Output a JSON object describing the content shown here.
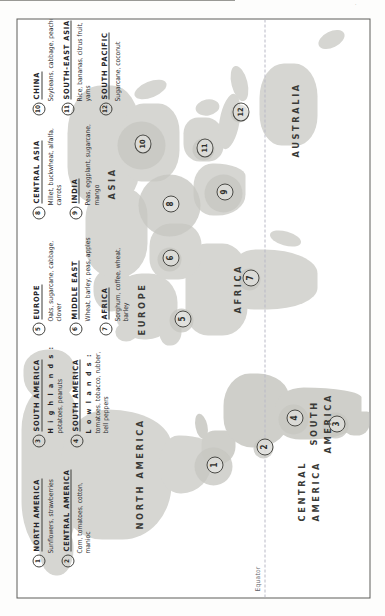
{
  "document": {
    "type": "map",
    "subject": "World agricultural crop production regions",
    "equator_label": "Equator",
    "scan_artifact": "·",
    "orientation": "page printed sideways (rotated 90°)"
  },
  "map_data": {
    "type": "map",
    "title": "World crop regions",
    "continents": [
      {
        "name": "NORTH AMERICA",
        "x": 120,
        "y": 122
      },
      {
        "name": "CENTRAL AMERICA",
        "x": 108,
        "y": 286,
        "lines": [
          "CENTRAL",
          "AMERICA"
        ]
      },
      {
        "name": "SOUTH AMERICA",
        "x": 152,
        "y": 300,
        "lines": [
          "SOUTH",
          "AMERICA"
        ]
      },
      {
        "name": "EUROPE",
        "x": 290,
        "y": 128
      },
      {
        "name": "AFRICA",
        "x": 300,
        "y": 216
      },
      {
        "name": "ASIA",
        "x": 392,
        "y": 104
      },
      {
        "name": "AUSTRALIA",
        "x": 470,
        "y": 268
      }
    ],
    "markers": [
      {
        "id": "1",
        "x": 131,
        "y": 196
      },
      {
        "id": "2",
        "x": 149,
        "y": 246
      },
      {
        "id": "3",
        "x": 172,
        "y": 318
      },
      {
        "id": "4",
        "x": 178,
        "y": 276
      },
      {
        "id": "5",
        "x": 277,
        "y": 164
      },
      {
        "id": "6",
        "x": 338,
        "y": 152
      },
      {
        "id": "7",
        "x": 318,
        "y": 232
      },
      {
        "id": "8",
        "x": 392,
        "y": 152
      },
      {
        "id": "9",
        "x": 404,
        "y": 206
      },
      {
        "id": "10",
        "x": 452,
        "y": 124
      },
      {
        "id": "11",
        "x": 448,
        "y": 186
      },
      {
        "id": "12",
        "x": 484,
        "y": 222
      }
    ],
    "halos": [
      {
        "for": "1",
        "cx": 131,
        "cy": 196,
        "r": 19
      },
      {
        "for": "2",
        "cx": 149,
        "cy": 246,
        "r": 10
      },
      {
        "for": "3",
        "cx": 172,
        "cy": 318,
        "r": 13
      },
      {
        "for": "4",
        "cx": 178,
        "cy": 276,
        "r": 15
      },
      {
        "for": "5",
        "cx": 277,
        "cy": 164,
        "r": 12
      },
      {
        "for": "6",
        "cx": 338,
        "cy": 152,
        "r": 12
      },
      {
        "for": "7",
        "cx": 318,
        "cy": 232,
        "r": 11
      },
      {
        "for": "8",
        "cx": 392,
        "cy": 152,
        "r": 31
      },
      {
        "for": "9",
        "cx": 404,
        "cy": 206,
        "r": 19
      },
      {
        "for": "10",
        "cx": 452,
        "cy": 124,
        "r": 24
      },
      {
        "for": "11",
        "cx": 448,
        "cy": 186,
        "r": 11
      },
      {
        "for": "12",
        "cx": 484,
        "cy": 222,
        "r": 9
      }
    ]
  },
  "legend": {
    "americas": [
      {
        "num": "1",
        "region": "NORTH AMERICA",
        "sub": "",
        "crops": "Sunflowers, strawberries"
      },
      {
        "num": "2",
        "region": "CENTRAL AMERICA",
        "sub": "",
        "crops": "Corn, tomatoes, cotton, manioc"
      },
      {
        "num": "3",
        "region": "SOUTH AMERICA",
        "sub": "H i g h l a n d s :",
        "crops": "potatoes, peanuts"
      },
      {
        "num": "4",
        "region": "SOUTH AMERICA",
        "sub": "L o w l a n d s :",
        "crops": "tomatoes, tobacco, rubber, bell peppers"
      }
    ],
    "emea": [
      {
        "num": "5",
        "region": "EUROPE",
        "sub": "",
        "crops": "Oats, sugarcane, cabbage, clover"
      },
      {
        "num": "6",
        "region": "MIDDLE EAST",
        "sub": "",
        "crops": "Wheat, barley, peas, apples"
      },
      {
        "num": "7",
        "region": "AFRICA",
        "sub": "",
        "crops": "Sorghum, coffee, wheat, barley"
      }
    ],
    "central_asia": [
      {
        "num": "8",
        "region": "CENTRAL ASIA",
        "sub": "",
        "crops": "Millet, buckwheat, alfalfa, carrots"
      },
      {
        "num": "9",
        "region": "INDIA",
        "sub": "",
        "crops": "Peas, eggplant, sugarcane, mango"
      }
    ],
    "east_asia": [
      {
        "num": "10",
        "region": "CHINA",
        "sub": "",
        "crops": "Soybeans, cabbage, peaches"
      },
      {
        "num": "11",
        "region": "SOUTH-EAST ASIA",
        "sub": "",
        "crops": "Rice, bananas, citrus fruit, yams"
      },
      {
        "num": "12",
        "region": "SOUTH PACIFIC",
        "sub": "",
        "crops": "Sugarcane, coconut"
      }
    ]
  }
}
